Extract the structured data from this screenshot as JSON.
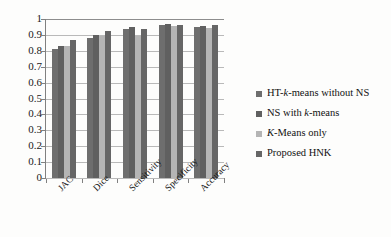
{
  "chart_data": {
    "type": "bar",
    "title": "",
    "xlabel": "",
    "ylabel": "",
    "ylim": [
      0,
      1
    ],
    "ytick_labels": [
      "1",
      "0.9",
      "0.8",
      "0.7",
      "0.6",
      "0.5",
      "0.4",
      "0.3",
      "0.2",
      "0.1",
      "0"
    ],
    "ytick_values": [
      1,
      0.9,
      0.8,
      0.7,
      0.6,
      0.5,
      0.4,
      0.3,
      0.2,
      0.1,
      0
    ],
    "grid": true,
    "legend_position": "right",
    "categories": [
      "JAC",
      "Dice",
      "Sensitivity",
      "Specificity",
      "Accuracy"
    ],
    "series": [
      {
        "name": "HT-k-means without NS",
        "name_html": "HT-<i>k</i>-means without NS",
        "color": "#6e6e6e",
        "values": [
          0.81,
          0.88,
          0.94,
          0.965,
          0.95
        ]
      },
      {
        "name": "NS with k-means",
        "name_html": "NS with <i>k</i>-means",
        "color": "#606060",
        "values": [
          0.83,
          0.9,
          0.95,
          0.97,
          0.955
        ]
      },
      {
        "name": "K-Means only",
        "name_html": "<i>K</i>-Means only",
        "color": "#b5b5b5",
        "values": [
          0.83,
          0.895,
          0.895,
          0.955,
          0.945
        ]
      },
      {
        "name": "Proposed HNK",
        "name_html": "Proposed HNK",
        "color": "#666666",
        "values": [
          0.865,
          0.925,
          0.94,
          0.96,
          0.96
        ]
      }
    ]
  }
}
